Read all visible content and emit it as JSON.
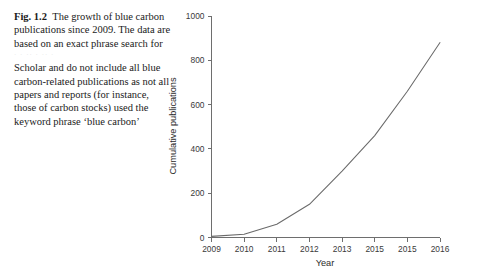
{
  "figure": {
    "label": "Fig. 1.2",
    "caption_part1": "The growth of blue carbon publications since 2009. The data are based on an exact phrase search for",
    "caption_smudge": "· ·   ··  · ··   ·",
    "caption_part2": "Scholar and do not include all blue carbon-related publications as not all papers and reports (for instance, those of carbon stocks) used the keyword phrase ‘blue carbon’"
  },
  "chart_data": {
    "type": "line",
    "title": "",
    "xlabel": "Year",
    "ylabel": "Cumulative publications",
    "x": [
      2009,
      2010,
      2011,
      2012,
      2013,
      2014,
      2015,
      2016
    ],
    "categories": [
      "2009",
      "2010",
      "2011",
      "2012",
      "2013",
      "2015",
      "2015",
      "2016"
    ],
    "values": [
      5,
      15,
      60,
      150,
      300,
      460,
      660,
      880
    ],
    "series": [
      {
        "name": "Cumulative publications",
        "values": [
          5,
          15,
          60,
          150,
          300,
          460,
          660,
          880
        ]
      }
    ],
    "xlim": [
      2009,
      2016
    ],
    "ylim": [
      0,
      1000
    ],
    "yticks": [
      0,
      200,
      400,
      600,
      800,
      1000
    ],
    "ytick_labels": [
      "0",
      "200",
      "400",
      "600",
      "800",
      "1000"
    ],
    "xticks": [
      2009,
      2010,
      2011,
      2012,
      2013,
      2014,
      2015,
      2016
    ],
    "xtick_labels": [
      "2009",
      "2010",
      "2011",
      "2012",
      "2013",
      "2015",
      "2015",
      "2016"
    ],
    "grid": false,
    "legend": false,
    "line_color": "#6a6a6a",
    "axis_color": "#6e6e6e"
  }
}
